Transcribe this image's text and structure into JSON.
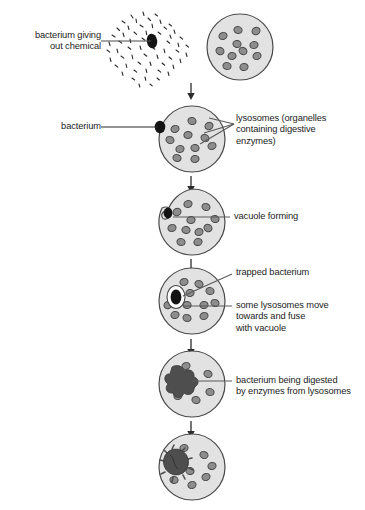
{
  "diagram": {
    "type": "biology-process-diagram",
    "colors": {
      "cytoplasm_fill": "#e2e2e2",
      "cell_outline": "#4a4a4a",
      "lysosome_fill": "#8d8d8d",
      "lysosome_outline": "#4a4a4a",
      "bacterium_dark": "#141414",
      "digested_blob": "#4e4e4e",
      "leader_line": "#5a5a5a",
      "text": "#1c1c1c",
      "background": "#ffffff"
    }
  },
  "labels": {
    "bacterium_giving_out_chemical": "bacterium giving\nout chemical",
    "bacterium": "bacterium",
    "lysosomes": "lysosomes (organelles\ncontaining digestive\nenzymes)",
    "vacuole_forming": "vacuole forming",
    "trapped_bacterium": "trapped bacterium",
    "some_lysosomes_move": "some lysosomes move\ntowards and fuse\nwith vacuole",
    "bacterium_being_digested": "bacterium being digested\nby enzymes from lysosomes"
  },
  "stages": [
    {
      "index": 1,
      "name": "attraction",
      "description": "bacterium releasing chemical next to white blood cell with lysosomes"
    },
    {
      "index": 2,
      "name": "contact",
      "description": "bacterium touching the cell membrane"
    },
    {
      "index": 3,
      "name": "vacuole-forming",
      "description": "cell membrane engulfing bacterium, vacuole forming"
    },
    {
      "index": 4,
      "name": "trapped",
      "description": "bacterium trapped inside vacuole, lysosomes moving toward it"
    },
    {
      "index": 5,
      "name": "digesting",
      "description": "bacterium being digested by enzymes from lysosomes"
    },
    {
      "index": 6,
      "name": "digested",
      "description": "remains of bacterium shrinking inside cell"
    }
  ],
  "cells": {
    "cell1": {
      "cx": 240,
      "cy": 47,
      "r": 33,
      "lysosomes": [
        [
          -17,
          -11
        ],
        [
          -2,
          -17
        ],
        [
          16,
          -16
        ],
        [
          -3,
          -3
        ],
        [
          14,
          -2
        ],
        [
          -20,
          4
        ],
        [
          -8,
          9
        ],
        [
          3,
          4
        ],
        [
          17,
          9
        ],
        [
          -13,
          19
        ],
        [
          4,
          20
        ]
      ]
    },
    "cell2": {
      "cx": 192,
      "cy": 139,
      "r": 33,
      "lysosomes": [
        [
          -17,
          -10
        ],
        [
          0,
          -18
        ],
        [
          17,
          -13
        ],
        [
          -22,
          1
        ],
        [
          -4,
          -4
        ],
        [
          13,
          -1
        ],
        [
          -12,
          10
        ],
        [
          3,
          9
        ],
        [
          20,
          7
        ],
        [
          -15,
          19
        ],
        [
          3,
          20
        ]
      ]
    },
    "cell3": {
      "cx": 192,
      "cy": 222,
      "r": 33,
      "lysosomes": [
        [
          -4,
          -18
        ],
        [
          14,
          -15
        ],
        [
          -15,
          -10
        ],
        [
          23,
          -3
        ],
        [
          -1,
          -2
        ],
        [
          16,
          6
        ],
        [
          -20,
          6
        ],
        [
          -6,
          8
        ],
        [
          7,
          10
        ],
        [
          -11,
          20
        ],
        [
          6,
          20
        ]
      ]
    },
    "cell4": {
      "cx": 192,
      "cy": 301,
      "r": 33,
      "lysosomes": [
        [
          -8,
          -19
        ],
        [
          7,
          -17
        ],
        [
          -2,
          -8
        ],
        [
          18,
          -10
        ],
        [
          -24,
          4
        ],
        [
          -5,
          4
        ],
        [
          12,
          4
        ],
        [
          23,
          2
        ],
        [
          -17,
          14
        ],
        [
          -5,
          17
        ],
        [
          12,
          15
        ]
      ]
    },
    "cell5": {
      "cx": 192,
      "cy": 384,
      "r": 33,
      "lysosomes": [
        [
          -6,
          -18
        ],
        [
          16,
          -10
        ],
        [
          -1,
          2
        ],
        [
          18,
          8
        ],
        [
          -14,
          12
        ],
        [
          4,
          16
        ]
      ]
    },
    "cell6": {
      "cx": 192,
      "cy": 467,
      "r": 33,
      "lysosomes": [
        [
          -8,
          -19
        ],
        [
          12,
          -12
        ],
        [
          20,
          -1
        ],
        [
          -2,
          4
        ],
        [
          14,
          10
        ],
        [
          -18,
          13
        ],
        [
          0,
          18
        ]
      ]
    }
  },
  "arrows": [
    {
      "x": 191,
      "y1": 83,
      "y2": 98
    },
    {
      "x": 191,
      "y1": 175,
      "y2": 190
    },
    {
      "x": 191,
      "y1": 258,
      "y2": 273
    },
    {
      "x": 191,
      "y1": 338,
      "y2": 353
    },
    {
      "x": 191,
      "y1": 420,
      "y2": 435
    }
  ]
}
